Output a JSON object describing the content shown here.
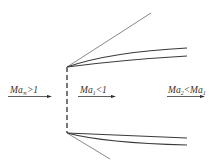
{
  "diagram": {
    "title": "",
    "colors": {
      "line": "#3a3a3a",
      "thin_line": "#6a6a6a",
      "dashed": "#777777",
      "text": "#333333"
    },
    "labels": {
      "freestream": {
        "base": "Ma",
        "sub": "∞",
        "rest": ">1"
      },
      "region1": {
        "base": "Ma",
        "sub": "1",
        "rest": "<1"
      },
      "region2": {
        "base": "Ma",
        "sub": "2",
        "rest": "<",
        "base2": "Ma",
        "sub2": "1"
      }
    },
    "elements": [
      "upstream-flow-arrow",
      "normal-shock-dashed-line",
      "upper-mach-line",
      "upper-jet-boundaries",
      "lower-jet-boundaries",
      "lower-mach-line",
      "region1-flow-arrow",
      "region2-flow-arrow"
    ]
  }
}
